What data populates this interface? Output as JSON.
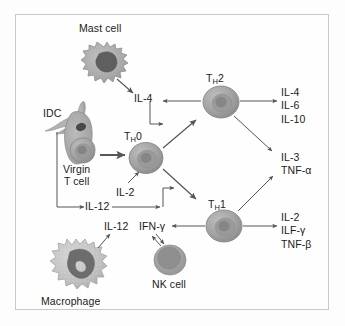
{
  "diagram": {
    "border_color": "#c9c9c9",
    "background_color": "#fefefe",
    "line_color": "#555555",
    "text_color": "#1b1b1b",
    "cell_fill": "#a8a8a8",
    "cell_nucleus": "#8f8f8f"
  },
  "cells": {
    "mast": {
      "label": "Mast cell",
      "body_color": "#b0b0b0",
      "nucleus_color": "#6f6f6f"
    },
    "idc": {
      "label": "IDC",
      "body_color": "#a9a9a9",
      "nucleus_color": "#595959"
    },
    "virgin_t": {
      "label_line1": "Virgin",
      "label_line2": "T cell",
      "body_color": "#a5a5a5",
      "nucleus_color": "#8a8a8a"
    },
    "th0": {
      "label_main": "T",
      "label_sub": "H",
      "label_tail": "0",
      "body_color": "#a5a5a5",
      "nucleus_color": "#8a8a8a"
    },
    "th1": {
      "label_main": "T",
      "label_sub": "H",
      "label_tail": "1",
      "body_color": "#a5a5a5",
      "nucleus_color": "#8a8a8a"
    },
    "th2": {
      "label_main": "T",
      "label_sub": "H",
      "label_tail": "2",
      "body_color": "#a5a5a5",
      "nucleus_color": "#8a8a8a"
    },
    "nk": {
      "label": "NK cell",
      "body_color": "#9c9c9c",
      "nucleus_color": "#8d8d8d"
    },
    "macrophage": {
      "label": "Macrophage",
      "body_color": "#c2c2c2",
      "nucleus_color": "#7d7d7d"
    }
  },
  "cytokines": {
    "il4_mast": "IL-4",
    "il2_costim": "IL-2",
    "il12_idc": "IL-12",
    "il12_macrophage": "IL-12",
    "ifng_nk": "IFN-γ"
  },
  "outputs": {
    "th2_products": [
      "IL-4",
      "IL-6",
      "IL-10"
    ],
    "shared_products": [
      "IL-3",
      "TNF-α"
    ],
    "th1_products": [
      "IL-2",
      "ILF-γ",
      "TNF-β"
    ]
  }
}
